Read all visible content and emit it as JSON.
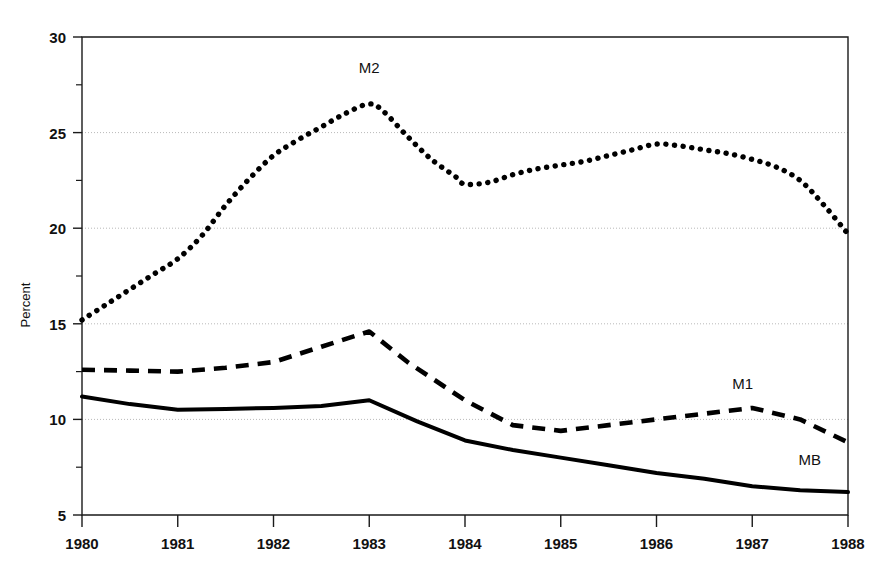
{
  "chart_data": {
    "type": "line",
    "title": "",
    "subtitle": "",
    "xlabel": "",
    "ylabel": "Percent",
    "xlim": [
      1980,
      1988
    ],
    "ylim": [
      5,
      30
    ],
    "y_ticks": [
      5,
      10,
      15,
      20,
      25,
      30
    ],
    "y_tick_labels": [
      "5",
      "10",
      "15",
      "20",
      "25",
      "30"
    ],
    "y_minor_ticks": [
      7.5,
      12.5,
      17.5,
      22.5,
      27.5
    ],
    "x_ticks": [
      1980,
      1981,
      1982,
      1983,
      1984,
      1985,
      1986,
      1987,
      1988
    ],
    "x_tick_labels": [
      "1980",
      "1981",
      "1982",
      "1983",
      "1984",
      "1985",
      "1986",
      "1987",
      "1988"
    ],
    "grid": "horizontal-major-dotted",
    "legend": "inline-labels",
    "background": "#ffffff",
    "line_color": "#000000",
    "grid_color": "#b9b9b9",
    "axis_color": "#1a1a1a",
    "series": [
      {
        "name": "M2",
        "label": "M2",
        "style": "dotted",
        "color": "#000000",
        "label_x": 1983.0,
        "label_y": 28.1,
        "x": [
          1980.0,
          1980.25,
          1980.5,
          1980.75,
          1981.0,
          1981.25,
          1981.5,
          1981.75,
          1982.0,
          1982.25,
          1982.5,
          1982.75,
          1983.0,
          1983.15,
          1983.4,
          1983.65,
          1983.9,
          1984.0,
          1984.25,
          1984.5,
          1984.75,
          1985.0,
          1985.25,
          1985.5,
          1985.75,
          1986.0,
          1986.25,
          1986.5,
          1986.75,
          1987.0,
          1987.25,
          1987.5,
          1987.75,
          1988.0
        ],
        "values": [
          15.2,
          16.0,
          16.8,
          17.6,
          18.4,
          19.6,
          21.2,
          22.6,
          23.8,
          24.6,
          25.3,
          26.0,
          26.5,
          26.1,
          24.8,
          23.6,
          22.7,
          22.3,
          22.4,
          22.8,
          23.1,
          23.3,
          23.5,
          23.8,
          24.1,
          24.4,
          24.3,
          24.1,
          23.9,
          23.6,
          23.2,
          22.5,
          21.2,
          19.7
        ]
      },
      {
        "name": "M1",
        "label": "M1",
        "style": "dashed",
        "color": "#000000",
        "label_x": 1986.9,
        "label_y": 11.6,
        "x": [
          1980.0,
          1980.5,
          1981.0,
          1981.5,
          1982.0,
          1982.5,
          1983.0,
          1983.4,
          1984.0,
          1984.5,
          1985.0,
          1985.5,
          1986.0,
          1986.5,
          1987.0,
          1987.5,
          1988.0
        ],
        "values": [
          12.6,
          12.55,
          12.5,
          12.7,
          13.0,
          13.8,
          14.6,
          13.0,
          11.0,
          9.7,
          9.4,
          9.7,
          10.0,
          10.3,
          10.6,
          10.0,
          8.8
        ]
      },
      {
        "name": "MB",
        "label": "MB",
        "style": "solid",
        "color": "#000000",
        "label_x": 1987.6,
        "label_y": 7.6,
        "x": [
          1980.0,
          1980.5,
          1981.0,
          1981.5,
          1982.0,
          1982.5,
          1983.0,
          1983.5,
          1984.0,
          1984.5,
          1985.0,
          1985.5,
          1986.0,
          1986.5,
          1987.0,
          1987.5,
          1988.0
        ],
        "values": [
          11.2,
          10.8,
          10.5,
          10.55,
          10.6,
          10.7,
          11.0,
          9.9,
          8.9,
          8.4,
          8.0,
          7.6,
          7.2,
          6.9,
          6.5,
          6.3,
          6.2
        ]
      }
    ]
  }
}
